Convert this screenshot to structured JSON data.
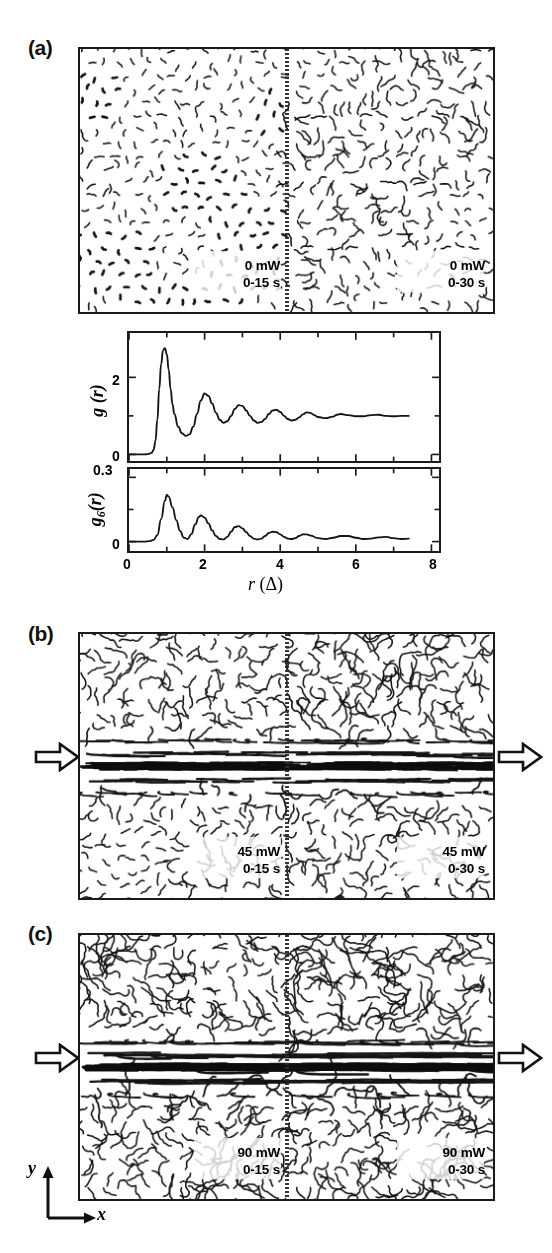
{
  "figure": {
    "panels": [
      {
        "id": "a",
        "label": "(a)",
        "left_tag": "0 mW\n0-15 s",
        "right_tag": "0 mW\n0-30 s",
        "power": "0 mW",
        "left_time": "0-15 s",
        "right_time": "0-30 s",
        "has_arrows": false,
        "shear_strength": 0.0,
        "left_disorder": 0.18,
        "right_disorder": 0.42
      },
      {
        "id": "b",
        "label": "(b)",
        "left_tag": "45 mW\n0-15 s",
        "right_tag": "45 mW\n0-30 s",
        "power": "45 mW",
        "left_time": "0-15 s",
        "right_time": "0-30 s",
        "has_arrows": true,
        "shear_strength": 0.55,
        "left_disorder": 0.55,
        "right_disorder": 0.78
      },
      {
        "id": "c",
        "label": "(c)",
        "left_tag": "90 mW\n0-15 s",
        "right_tag": "90 mW\n0-30 s",
        "power": "90 mW",
        "left_time": "0-15 s",
        "right_time": "0-30 s",
        "has_arrows": true,
        "shear_strength": 1.0,
        "left_disorder": 0.84,
        "right_disorder": 1.0
      }
    ],
    "axis_indicator": {
      "x_label": "x",
      "y_label": "y"
    },
    "arrow_icon_name": "shear-direction-arrow"
  },
  "chart_data": [
    {
      "type": "line",
      "name": "pair-correlation",
      "ylabel": "g (r)",
      "xlabel": "r (Δ)",
      "xlim": [
        0,
        8.2
      ],
      "ylim": [
        -0.12,
        3.1
      ],
      "yticks": [
        0,
        2
      ],
      "ytick_labels": [
        "0",
        "2"
      ],
      "xticks": [
        0,
        2,
        4,
        6,
        8
      ],
      "xtick_labels": [
        "0",
        "2",
        "4",
        "6",
        "8"
      ],
      "xminor": [
        1,
        3,
        5,
        7
      ],
      "grid": false,
      "legend": null,
      "x": [
        0.0,
        0.2,
        0.4,
        0.5,
        0.6,
        0.65,
        0.7,
        0.75,
        0.8,
        0.85,
        0.9,
        0.95,
        1.0,
        1.05,
        1.1,
        1.15,
        1.2,
        1.3,
        1.4,
        1.5,
        1.6,
        1.7,
        1.8,
        1.9,
        2.0,
        2.1,
        2.2,
        2.3,
        2.4,
        2.5,
        2.6,
        2.7,
        2.8,
        2.9,
        3.0,
        3.1,
        3.2,
        3.3,
        3.4,
        3.5,
        3.6,
        3.7,
        3.8,
        3.9,
        4.0,
        4.1,
        4.2,
        4.3,
        4.4,
        4.5,
        4.6,
        4.7,
        4.8,
        4.9,
        5.0,
        5.2,
        5.4,
        5.5,
        5.6,
        5.8,
        6.0,
        6.2,
        6.4,
        6.6,
        6.8,
        7.0,
        7.2,
        7.4
      ],
      "y": [
        0.0,
        0.0,
        0.0,
        0.01,
        0.04,
        0.12,
        0.35,
        0.9,
        1.7,
        2.35,
        2.7,
        2.76,
        2.6,
        2.2,
        1.7,
        1.3,
        1.05,
        0.72,
        0.55,
        0.48,
        0.52,
        0.72,
        1.05,
        1.4,
        1.58,
        1.52,
        1.32,
        1.08,
        0.9,
        0.82,
        0.86,
        1.0,
        1.18,
        1.28,
        1.26,
        1.14,
        1.0,
        0.88,
        0.82,
        0.84,
        0.92,
        1.05,
        1.14,
        1.16,
        1.1,
        1.0,
        0.92,
        0.88,
        0.9,
        0.96,
        1.04,
        1.09,
        1.08,
        1.02,
        0.97,
        0.94,
        0.98,
        1.03,
        1.05,
        1.02,
        0.99,
        0.99,
        1.02,
        1.03,
        1.0,
        0.99,
        1.0,
        1.0
      ],
      "peaks": [
        {
          "r": 1.0,
          "g": 2.76
        },
        {
          "r": 2.0,
          "g": 1.58
        },
        {
          "r": 2.9,
          "g": 1.28
        },
        {
          "r": 3.9,
          "g": 1.16
        },
        {
          "r": 4.7,
          "g": 1.09
        },
        {
          "r": 5.6,
          "g": 1.05
        }
      ],
      "asymptote": 1.0
    },
    {
      "type": "line",
      "name": "bond-orientational-correlation",
      "ylabel": "g6(r)",
      "xlabel": "r (Δ)",
      "xlim": [
        0,
        8.2
      ],
      "ylim": [
        -0.035,
        0.33
      ],
      "yticks": [
        0,
        0.3
      ],
      "ytick_labels": [
        "0",
        "0.3"
      ],
      "xticks": [
        0,
        2,
        4,
        6,
        8
      ],
      "xtick_labels": [
        "0",
        "2",
        "4",
        "6",
        "8"
      ],
      "xminor": [
        1,
        3,
        5,
        7
      ],
      "grid": false,
      "legend": null,
      "x": [
        0.0,
        0.2,
        0.4,
        0.55,
        0.65,
        0.75,
        0.85,
        0.95,
        1.0,
        1.05,
        1.15,
        1.25,
        1.35,
        1.45,
        1.55,
        1.65,
        1.75,
        1.85,
        1.9,
        2.0,
        2.1,
        2.2,
        2.3,
        2.4,
        2.5,
        2.6,
        2.7,
        2.8,
        2.9,
        3.0,
        3.1,
        3.2,
        3.3,
        3.4,
        3.5,
        3.6,
        3.7,
        3.8,
        3.9,
        4.0,
        4.1,
        4.2,
        4.3,
        4.4,
        4.5,
        4.6,
        4.7,
        4.8,
        5.0,
        5.2,
        5.4,
        5.6,
        5.8,
        6.0,
        6.2,
        6.4,
        6.6,
        6.8,
        7.0,
        7.2,
        7.4
      ],
      "y": [
        0.0,
        0.0,
        0.0,
        0.002,
        0.008,
        0.03,
        0.105,
        0.19,
        0.218,
        0.21,
        0.16,
        0.1,
        0.05,
        0.018,
        0.012,
        0.035,
        0.08,
        0.115,
        0.122,
        0.112,
        0.085,
        0.052,
        0.026,
        0.012,
        0.01,
        0.022,
        0.046,
        0.068,
        0.072,
        0.062,
        0.044,
        0.026,
        0.014,
        0.01,
        0.014,
        0.026,
        0.04,
        0.046,
        0.044,
        0.034,
        0.022,
        0.014,
        0.012,
        0.016,
        0.026,
        0.034,
        0.034,
        0.028,
        0.016,
        0.012,
        0.018,
        0.026,
        0.026,
        0.018,
        0.012,
        0.014,
        0.02,
        0.022,
        0.016,
        0.012,
        0.014
      ],
      "peaks": [
        {
          "r": 1.0,
          "g6": 0.218
        },
        {
          "r": 1.9,
          "g6": 0.122
        },
        {
          "r": 2.9,
          "g6": 0.072
        },
        {
          "r": 3.8,
          "g6": 0.046
        },
        {
          "r": 4.65,
          "g6": 0.034
        },
        {
          "r": 5.65,
          "g6": 0.026
        }
      ],
      "asymptote": 0.0
    }
  ]
}
